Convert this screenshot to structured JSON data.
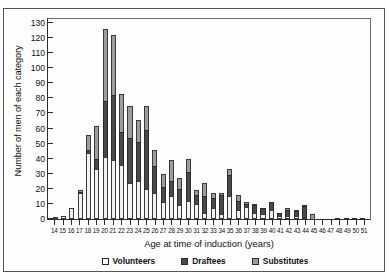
{
  "chart_data": {
    "type": "bar",
    "stacked": true,
    "title": "",
    "xlabel": "Age at time of induction (years)",
    "ylabel": "Number of men of each category",
    "ylim": [
      0,
      134
    ],
    "yticks": [
      0,
      10,
      20,
      30,
      40,
      50,
      60,
      70,
      80,
      90,
      100,
      110,
      120,
      130
    ],
    "grid": false,
    "legend_position": "bottom",
    "categories": [
      14,
      15,
      16,
      17,
      18,
      19,
      20,
      21,
      22,
      23,
      24,
      25,
      26,
      27,
      28,
      29,
      30,
      31,
      32,
      33,
      34,
      35,
      36,
      37,
      38,
      39,
      40,
      41,
      42,
      43,
      44,
      45,
      46,
      47,
      48,
      49,
      50,
      51
    ],
    "series": [
      {
        "name": "Volunteers",
        "color": "#f2f2f0",
        "values": [
          1,
          2,
          7,
          17,
          44,
          33,
          41,
          39,
          36,
          24,
          25,
          20,
          17,
          11,
          15,
          9,
          12,
          10,
          4,
          7,
          3,
          15,
          6,
          8,
          4,
          3,
          6,
          2,
          2,
          2,
          1,
          0,
          0,
          0,
          0,
          0,
          0,
          0
        ]
      },
      {
        "name": "Draftees",
        "color": "#4a4a4a",
        "values": [
          0,
          0,
          0,
          1,
          2,
          7,
          37,
          43,
          22,
          30,
          26,
          39,
          18,
          10,
          10,
          11,
          19,
          6,
          11,
          7,
          13,
          14,
          6,
          2,
          5,
          4,
          5,
          2,
          4,
          3,
          7,
          0,
          0,
          0,
          1,
          1,
          1,
          1
        ]
      },
      {
        "name": "Substitutes",
        "color": "#9d9d9d",
        "values": [
          0,
          0,
          0,
          1,
          10,
          22,
          48,
          40,
          25,
          21,
          15,
          16,
          11,
          9,
          14,
          7,
          9,
          3,
          9,
          3,
          1,
          4,
          4,
          1,
          1,
          0,
          0,
          0,
          1,
          1,
          1,
          3,
          0,
          0,
          0,
          0,
          0,
          0
        ]
      }
    ],
    "totals": [
      1,
      2,
      7,
      19,
      56,
      62,
      126,
      122,
      83,
      75,
      66,
      75,
      46,
      30,
      39,
      27,
      40,
      19,
      24,
      17,
      17,
      33,
      16,
      11,
      10,
      7,
      11,
      4,
      7,
      6,
      9,
      3,
      0,
      0,
      1,
      1,
      1,
      1
    ]
  },
  "legend": {
    "items": [
      {
        "label": "Volunteers"
      },
      {
        "label": "Draftees"
      },
      {
        "label": "Substitutes"
      }
    ]
  }
}
